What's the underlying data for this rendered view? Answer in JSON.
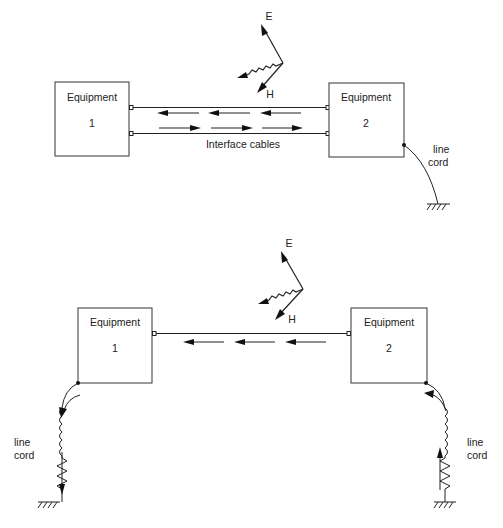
{
  "top_diagram": {
    "equipment_1": {
      "title": "Equipment",
      "number": "1"
    },
    "equipment_2": {
      "title": "Equipment",
      "number": "2"
    },
    "cable_label": "Interface cables",
    "field": {
      "e_label": "E",
      "h_label": "H"
    },
    "line_cord_label_1": "line",
    "line_cord_label_2": "cord"
  },
  "bottom_diagram": {
    "equipment_1": {
      "title": "Equipment",
      "number": "1"
    },
    "equipment_2": {
      "title": "Equipment",
      "number": "2"
    },
    "field": {
      "e_label": "E",
      "h_label": "H"
    },
    "left_cord_label_1": "line",
    "left_cord_label_2": "cord",
    "right_cord_label_1": "line",
    "right_cord_label_2": "cord"
  },
  "colors": {
    "ink": "#222222",
    "background": "#ffffff"
  }
}
